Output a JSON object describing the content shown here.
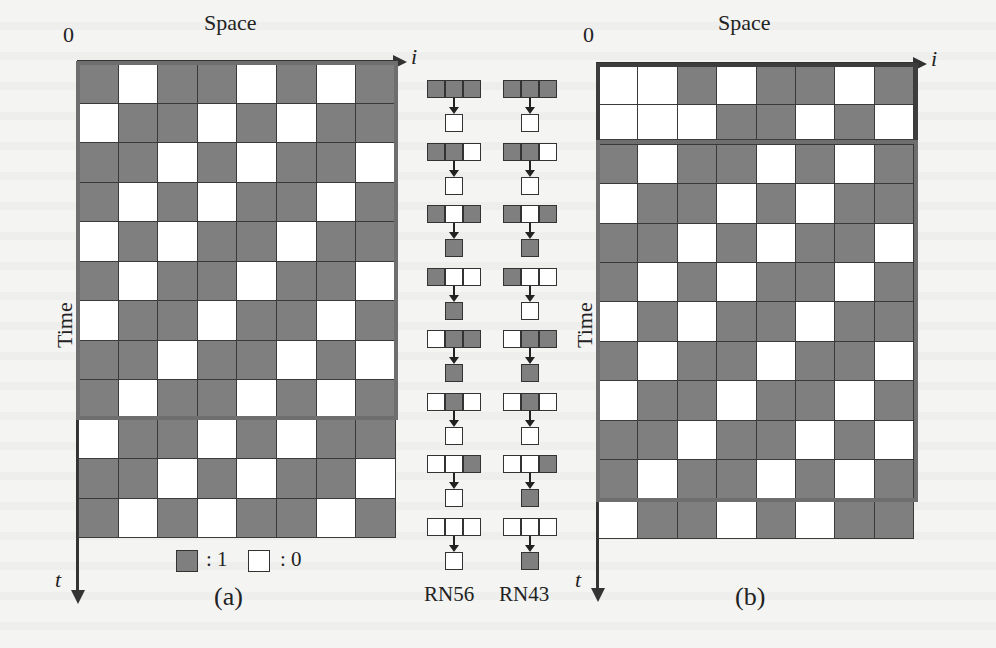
{
  "figure": {
    "panel_a": {
      "caption": "(a)",
      "x_axis_label": "Space",
      "x_axis_var": "i",
      "y_axis_label": "Time",
      "y_axis_var": "t",
      "origin_label": "0",
      "rows": [
        [
          1,
          0,
          1,
          1,
          0,
          1,
          0,
          1
        ],
        [
          0,
          1,
          1,
          0,
          1,
          0,
          1,
          1
        ],
        [
          1,
          1,
          0,
          1,
          0,
          1,
          1,
          0
        ],
        [
          1,
          0,
          1,
          0,
          1,
          1,
          0,
          1
        ],
        [
          0,
          1,
          0,
          1,
          1,
          0,
          1,
          1
        ],
        [
          1,
          0,
          1,
          1,
          0,
          1,
          1,
          0
        ],
        [
          0,
          1,
          1,
          0,
          1,
          1,
          0,
          1
        ],
        [
          1,
          1,
          0,
          1,
          1,
          0,
          1,
          0
        ],
        [
          1,
          0,
          1,
          1,
          0,
          1,
          0,
          1
        ],
        [
          0,
          1,
          1,
          0,
          1,
          0,
          1,
          1
        ],
        [
          1,
          1,
          0,
          1,
          0,
          1,
          1,
          0
        ],
        [
          1,
          0,
          1,
          0,
          1,
          1,
          0,
          1
        ]
      ],
      "highlight_rows": [
        0,
        8
      ],
      "legend": [
        {
          "state": 1,
          "label": ": 1"
        },
        {
          "state": 0,
          "label": ": 0"
        }
      ]
    },
    "rules": [
      {
        "name": "RN56",
        "transitions": [
          {
            "neighborhood": [
              1,
              1,
              1
            ],
            "next": 0
          },
          {
            "neighborhood": [
              1,
              1,
              0
            ],
            "next": 0
          },
          {
            "neighborhood": [
              1,
              0,
              1
            ],
            "next": 1
          },
          {
            "neighborhood": [
              1,
              0,
              0
            ],
            "next": 1
          },
          {
            "neighborhood": [
              0,
              1,
              1
            ],
            "next": 1
          },
          {
            "neighborhood": [
              0,
              1,
              0
            ],
            "next": 0
          },
          {
            "neighborhood": [
              0,
              0,
              1
            ],
            "next": 0
          },
          {
            "neighborhood": [
              0,
              0,
              0
            ],
            "next": 0
          }
        ]
      },
      {
        "name": "RN43",
        "transitions": [
          {
            "neighborhood": [
              1,
              1,
              1
            ],
            "next": 0
          },
          {
            "neighborhood": [
              1,
              1,
              0
            ],
            "next": 0
          },
          {
            "neighborhood": [
              1,
              0,
              1
            ],
            "next": 1
          },
          {
            "neighborhood": [
              1,
              0,
              0
            ],
            "next": 0
          },
          {
            "neighborhood": [
              0,
              1,
              1
            ],
            "next": 1
          },
          {
            "neighborhood": [
              0,
              1,
              0
            ],
            "next": 0
          },
          {
            "neighborhood": [
              0,
              0,
              1
            ],
            "next": 1
          },
          {
            "neighborhood": [
              0,
              0,
              0
            ],
            "next": 1
          }
        ]
      }
    ],
    "panel_b": {
      "caption": "(b)",
      "x_axis_label": "Space",
      "x_axis_var": "i",
      "y_axis_label": "Time",
      "y_axis_var": "t",
      "origin_label": "0",
      "rows": [
        [
          0,
          0,
          1,
          0,
          1,
          1,
          0,
          1
        ],
        [
          0,
          0,
          0,
          1,
          1,
          0,
          1,
          0
        ],
        [
          1,
          0,
          1,
          1,
          0,
          1,
          0,
          1
        ],
        [
          0,
          1,
          1,
          0,
          1,
          0,
          1,
          1
        ],
        [
          1,
          1,
          0,
          1,
          0,
          1,
          1,
          0
        ],
        [
          1,
          0,
          1,
          0,
          1,
          1,
          0,
          1
        ],
        [
          0,
          1,
          0,
          1,
          1,
          0,
          1,
          1
        ],
        [
          1,
          0,
          1,
          1,
          0,
          1,
          1,
          0
        ],
        [
          0,
          1,
          1,
          0,
          1,
          1,
          0,
          1
        ],
        [
          1,
          1,
          0,
          1,
          1,
          0,
          1,
          0
        ],
        [
          1,
          0,
          1,
          1,
          0,
          1,
          0,
          1
        ],
        [
          0,
          1,
          1,
          0,
          1,
          0,
          1,
          1
        ]
      ],
      "highlight_blocks": [
        [
          0,
          1
        ],
        [
          2,
          10
        ]
      ]
    },
    "colors": {
      "state_1": "#7f7f7f",
      "state_0": "#ffffff",
      "grid_line": "#3a3a3a",
      "frame": "#6e6e6e"
    }
  }
}
